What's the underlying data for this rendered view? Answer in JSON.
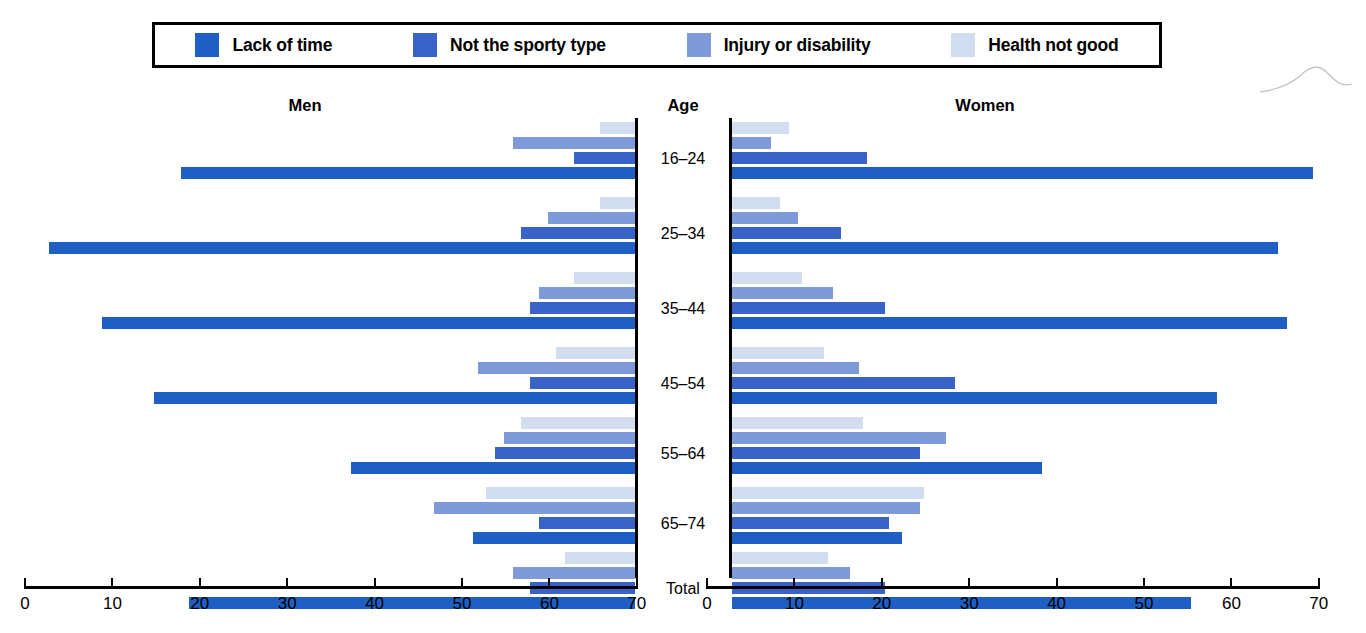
{
  "legend": {
    "items": [
      {
        "label": "Lack of time",
        "key": "lack_of_time",
        "color": "#1f5fc4",
        "swatch_name": "legend-swatch-lack-of-time"
      },
      {
        "label": "Not the sporty type",
        "key": "not_sporty",
        "color": "#3a63c8",
        "swatch_name": "legend-swatch-not-sporty"
      },
      {
        "label": "Injury or disability",
        "key": "injury_disability",
        "color": "#7f9ad9",
        "swatch_name": "legend-swatch-injury"
      },
      {
        "label": "Health not good",
        "key": "health_not_good",
        "color": "#d3ddf0",
        "swatch_name": "legend-swatch-health"
      }
    ]
  },
  "headings": {
    "men": "Men",
    "age": "Age",
    "women": "Women"
  },
  "chart_data": {
    "type": "bar",
    "orientation": "horizontal",
    "layout": "population-pyramid",
    "title": "",
    "xlabel": "",
    "ylabel": "Age",
    "xlim": [
      0,
      70
    ],
    "grid": false,
    "legend_position": "top",
    "tick_values": [
      0,
      10,
      20,
      30,
      40,
      50,
      60,
      70
    ],
    "left_tick_labels": [
      "70",
      "60",
      "50",
      "40",
      "30",
      "20",
      "10",
      "0"
    ],
    "right_tick_labels": [
      "0",
      "10",
      "20",
      "30",
      "40",
      "50",
      "60",
      "70"
    ],
    "categories": [
      "16–24",
      "25–34",
      "35–44",
      "45–54",
      "55–64",
      "65–74",
      "Total"
    ],
    "series_order": [
      "health_not_good",
      "injury_disability",
      "not_sporty",
      "lack_of_time"
    ],
    "series": [
      {
        "name": "Health not good",
        "key": "health_not_good",
        "color": "#d3ddf0",
        "men": [
          4,
          4,
          7,
          9,
          13,
          17,
          8
        ],
        "women": [
          6.5,
          5.5,
          8,
          10.5,
          15,
          22,
          11
        ]
      },
      {
        "name": "Injury or disability",
        "key": "injury_disability",
        "color": "#7f9ad9",
        "men": [
          14,
          10,
          11,
          18,
          15,
          23,
          14
        ],
        "women": [
          4.5,
          7.5,
          11.5,
          14.5,
          24.5,
          21.5,
          13.5
        ]
      },
      {
        "name": "Not the sporty type",
        "key": "not_sporty",
        "color": "#3a63c8",
        "men": [
          7,
          13,
          12,
          12,
          16,
          11,
          12
        ],
        "women": [
          15.5,
          12.5,
          17.5,
          25.5,
          21.5,
          18,
          17.5
        ]
      },
      {
        "name": "Lack of time",
        "key": "lack_of_time",
        "color": "#1f5fc4",
        "men": [
          52,
          67,
          61,
          55,
          32.5,
          18.5,
          51
        ],
        "women": [
          66.5,
          62.5,
          63.5,
          55.5,
          35.5,
          19.5,
          52.5
        ]
      }
    ]
  }
}
